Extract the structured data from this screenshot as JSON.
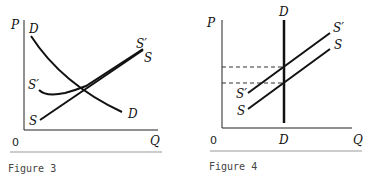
{
  "figures": [
    {
      "caption": "Figure 3",
      "y_axis_label": "P",
      "x_axis_label": "Q",
      "origin_label": "0",
      "curves": [
        {
          "name": "demand",
          "label_start": "D",
          "label_end": "D"
        },
        {
          "name": "supply",
          "label_start": "S",
          "label_end": "S"
        },
        {
          "name": "supply-shifted",
          "label_start": "S′",
          "label_end": "S′"
        }
      ]
    },
    {
      "caption": "Figure 4",
      "y_axis_label": "P",
      "x_axis_label": "Q",
      "origin_label": "0",
      "curves": [
        {
          "name": "demand-vertical",
          "label_start": "D",
          "label_end": "D"
        },
        {
          "name": "supply",
          "label_start": "S",
          "label_end": "S"
        },
        {
          "name": "supply-shifted",
          "label_start": "S′",
          "label_end": "S′"
        }
      ]
    }
  ]
}
